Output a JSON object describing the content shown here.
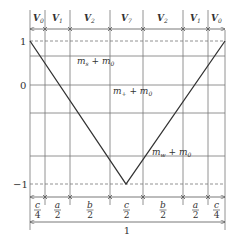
{
  "diagram": {
    "top_segments": [
      "V0",
      "V1",
      "V2",
      "V7",
      "V2",
      "V1",
      "V0"
    ],
    "top_labels": [
      {
        "main": "V",
        "sub": "0"
      },
      {
        "main": "V",
        "sub": "1"
      },
      {
        "main": "V",
        "sub": "2"
      },
      {
        "main": "V",
        "sub": "7"
      },
      {
        "main": "V",
        "sub": "2"
      },
      {
        "main": "V",
        "sub": "1"
      },
      {
        "main": "V",
        "sub": "0"
      }
    ],
    "bottom_labels": [
      {
        "num": "c",
        "den": "4"
      },
      {
        "num": "a",
        "den": "2"
      },
      {
        "num": "b",
        "den": "2"
      },
      {
        "num": "c",
        "den": "2"
      },
      {
        "num": "b",
        "den": "2"
      },
      {
        "num": "a",
        "den": "2"
      },
      {
        "num": "c",
        "den": "4"
      }
    ],
    "total_label": "1",
    "y_ticks": [
      {
        "label": "1",
        "value": 1
      },
      {
        "label": "0",
        "value": 0
      },
      {
        "label": "−1",
        "value": -1
      }
    ],
    "annotations": [
      {
        "main": "m",
        "sub": "s",
        "rest": " + m",
        "sub2": "0"
      },
      {
        "main": "m",
        "sub": "+",
        "rest": " + m",
        "sub2": "0"
      },
      {
        "main": "m",
        "sub": "w",
        "rest": " + m",
        "sub2": "0"
      }
    ],
    "waveform": {
      "type": "V-shaped line",
      "points": [
        [
          0,
          1
        ],
        [
          0.5,
          -1
        ],
        [
          1,
          1
        ]
      ]
    }
  }
}
